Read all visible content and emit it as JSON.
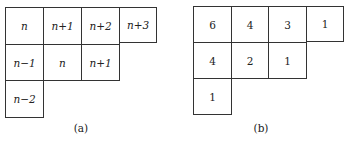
{
  "figure": {
    "panels": [
      {
        "id": "a",
        "caption": "(a)",
        "rows": [
          [
            "n",
            "n+1",
            "n+2",
            "n+3"
          ],
          [
            "n−1",
            "n",
            "n+1"
          ],
          [
            "n−2"
          ]
        ]
      },
      {
        "id": "b",
        "caption": "(b)",
        "rows": [
          [
            "6",
            "4",
            "3",
            "1"
          ],
          [
            "4",
            "2",
            "1"
          ],
          [
            "1"
          ]
        ]
      }
    ]
  }
}
